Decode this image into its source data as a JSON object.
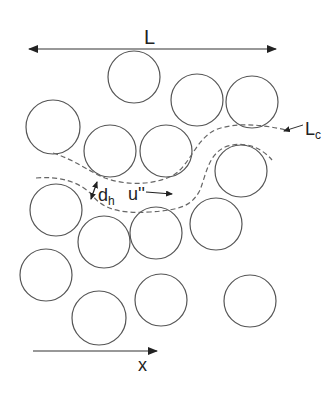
{
  "diagram": {
    "labels": {
      "length": "L",
      "characteristic_length_main": "L",
      "characteristic_length_sub": "c",
      "hydraulic_diameter_main": "d",
      "hydraulic_diameter_sub": "h",
      "velocity_fluctuation": "u''",
      "axis": "x"
    },
    "colors": {
      "stroke": "#555555",
      "text": "#222222",
      "dash": "#666666"
    },
    "particles": [
      {
        "cx": 134,
        "cy": 77,
        "r": 26
      },
      {
        "cx": 197,
        "cy": 100,
        "r": 26
      },
      {
        "cx": 252,
        "cy": 102,
        "r": 26
      },
      {
        "cx": 53,
        "cy": 127,
        "r": 27
      },
      {
        "cx": 110,
        "cy": 151,
        "r": 26
      },
      {
        "cx": 166,
        "cy": 151,
        "r": 26
      },
      {
        "cx": 241,
        "cy": 171,
        "r": 26
      },
      {
        "cx": 56,
        "cy": 210,
        "r": 26
      },
      {
        "cx": 104,
        "cy": 242,
        "r": 26
      },
      {
        "cx": 156,
        "cy": 233,
        "r": 26
      },
      {
        "cx": 216,
        "cy": 224,
        "r": 26
      },
      {
        "cx": 46,
        "cy": 275,
        "r": 26
      },
      {
        "cx": 99,
        "cy": 318,
        "r": 27
      },
      {
        "cx": 161,
        "cy": 300,
        "r": 26
      },
      {
        "cx": 250,
        "cy": 301,
        "r": 26
      }
    ]
  }
}
